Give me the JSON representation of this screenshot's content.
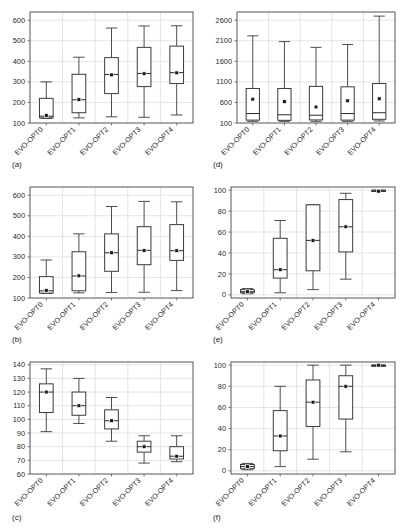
{
  "figure": {
    "categories": [
      "EVO-OPT0",
      "EVO-OPT1",
      "EVO-OPT2",
      "EVO-OPT3",
      "EVO-OPT4"
    ],
    "captions": [
      "(a)",
      "(b)",
      "(c)",
      "(d)",
      "(e)",
      "(f)"
    ],
    "colors": {
      "box_stroke": "#3a3a3a",
      "whisker": "#3a3a3a",
      "median": "#2b2b2b",
      "mean_marker": "#1a1a1a",
      "grid": "#d9d9d9",
      "axis": "#555555",
      "background": "#ffffff"
    }
  },
  "chart_data": [
    {
      "type": "box",
      "panel": "(a)",
      "title": "",
      "xlabel": "",
      "ylabel": "",
      "categories": [
        "EVO-OPT0",
        "EVO-OPT1",
        "EVO-OPT2",
        "EVO-OPT3",
        "EVO-OPT4"
      ],
      "ylim": [
        100,
        640
      ],
      "yticks": [
        100,
        200,
        300,
        400,
        500,
        600
      ],
      "ytick_labels": [
        "100",
        "200",
        "300",
        "400",
        "500",
        "600"
      ],
      "grid": true,
      "boxes": [
        {
          "category": "EVO-OPT0",
          "min": 122,
          "q1": 125,
          "median": 133,
          "q3": 220,
          "max": 300,
          "mean": 137
        },
        {
          "category": "EVO-OPT1",
          "min": 125,
          "q1": 150,
          "median": 213,
          "q3": 337,
          "max": 420,
          "mean": 214
        },
        {
          "category": "EVO-OPT2",
          "min": 130,
          "q1": 243,
          "median": 336,
          "q3": 418,
          "max": 562,
          "mean": 334
        },
        {
          "category": "EVO-OPT3",
          "min": 128,
          "q1": 277,
          "median": 341,
          "q3": 468,
          "max": 572,
          "mean": 340
        },
        {
          "category": "EVO-OPT4",
          "min": 139,
          "q1": 292,
          "median": 345,
          "q3": 474,
          "max": 573,
          "mean": 344
        }
      ]
    },
    {
      "type": "box",
      "panel": "(b)",
      "title": "",
      "xlabel": "",
      "ylabel": "",
      "categories": [
        "EVO-OPT0",
        "EVO-OPT1",
        "EVO-OPT2",
        "EVO-OPT3",
        "EVO-OPT4"
      ],
      "ylim": [
        100,
        640
      ],
      "yticks": [
        100,
        200,
        300,
        400,
        500,
        600
      ],
      "ytick_labels": [
        "100",
        "200",
        "300",
        "400",
        "500",
        "600"
      ],
      "grid": true,
      "boxes": [
        {
          "category": "EVO-OPT0",
          "min": 122,
          "q1": 124,
          "median": 135,
          "q3": 204,
          "max": 285,
          "mean": 137
        },
        {
          "category": "EVO-OPT1",
          "min": 125,
          "q1": 135,
          "median": 207,
          "q3": 325,
          "max": 412,
          "mean": 208
        },
        {
          "category": "EVO-OPT2",
          "min": 127,
          "q1": 230,
          "median": 320,
          "q3": 412,
          "max": 545,
          "mean": 320
        },
        {
          "category": "EVO-OPT3",
          "min": 128,
          "q1": 262,
          "median": 332,
          "q3": 447,
          "max": 570,
          "mean": 331
        },
        {
          "category": "EVO-OPT4",
          "min": 136,
          "q1": 283,
          "median": 330,
          "q3": 457,
          "max": 568,
          "mean": 330
        }
      ]
    },
    {
      "type": "box",
      "panel": "(c)",
      "title": "",
      "xlabel": "",
      "ylabel": "",
      "categories": [
        "EVO-OPT0",
        "EVO-OPT1",
        "EVO-OPT2",
        "EVO-OPT3",
        "EVO-OPT4"
      ],
      "ylim": [
        60,
        142
      ],
      "yticks": [
        60,
        70,
        80,
        90,
        100,
        110,
        120,
        130,
        140
      ],
      "ytick_labels": [
        "60",
        "70",
        "80",
        "90",
        "100",
        "110",
        "120",
        "130",
        "140"
      ],
      "grid": true,
      "boxes": [
        {
          "category": "EVO-OPT0",
          "min": 91,
          "q1": 105,
          "median": 120,
          "q3": 126,
          "max": 137,
          "mean": 120
        },
        {
          "category": "EVO-OPT1",
          "min": 97,
          "q1": 103,
          "median": 110,
          "q3": 120,
          "max": 130,
          "mean": 110
        },
        {
          "category": "EVO-OPT2",
          "min": 84,
          "q1": 93,
          "median": 99,
          "q3": 107,
          "max": 116,
          "mean": 99
        },
        {
          "category": "EVO-OPT3",
          "min": 68,
          "q1": 76,
          "median": 80,
          "q3": 84,
          "max": 88,
          "mean": 80
        },
        {
          "category": "EVO-OPT4",
          "min": 69,
          "q1": 71,
          "median": 73,
          "q3": 80,
          "max": 88,
          "mean": 73
        }
      ]
    },
    {
      "type": "box",
      "panel": "(d)",
      "title": "",
      "xlabel": "",
      "ylabel": "",
      "categories": [
        "EVO-OPT0",
        "EVO-OPT1",
        "EVO-OPT2",
        "EVO-OPT3",
        "EVO-OPT4"
      ],
      "ylim": [
        100,
        2800
      ],
      "yticks": [
        100,
        600,
        1100,
        1600,
        2100,
        2600
      ],
      "ytick_labels": [
        "100",
        "600",
        "1100",
        "1600",
        "2100",
        "2600"
      ],
      "grid": true,
      "boxes": [
        {
          "category": "EVO-OPT0",
          "min": 140,
          "q1": 170,
          "median": 330,
          "q3": 940,
          "max": 2220,
          "mean": 680
        },
        {
          "category": "EVO-OPT1",
          "min": 140,
          "q1": 165,
          "median": 300,
          "q3": 940,
          "max": 2080,
          "mean": 620
        },
        {
          "category": "EVO-OPT2",
          "min": 140,
          "q1": 175,
          "median": 290,
          "q3": 990,
          "max": 1940,
          "mean": 490
        },
        {
          "category": "EVO-OPT3",
          "min": 140,
          "q1": 170,
          "median": 330,
          "q3": 980,
          "max": 2010,
          "mean": 640
        },
        {
          "category": "EVO-OPT4",
          "min": 150,
          "q1": 190,
          "median": 350,
          "q3": 1060,
          "max": 2700,
          "mean": 690
        }
      ]
    },
    {
      "type": "box",
      "panel": "(e)",
      "title": "",
      "xlabel": "",
      "ylabel": "",
      "categories": [
        "EVO-OPT0",
        "EVO-OPT1",
        "EVO-OPT2",
        "EVO-OPT3",
        "EVO-OPT4"
      ],
      "ylim": [
        -3,
        103
      ],
      "yticks": [
        0,
        20,
        40,
        60,
        80,
        100
      ],
      "ytick_labels": [
        "0",
        "20",
        "40",
        "60",
        "80",
        "100"
      ],
      "grid": true,
      "boxes": [
        {
          "category": "EVO-OPT0",
          "min": 1,
          "q1": 2,
          "median": 3,
          "q3": 5,
          "max": 6,
          "mean": 3
        },
        {
          "category": "EVO-OPT1",
          "min": 2,
          "q1": 16,
          "median": 24,
          "q3": 54,
          "max": 71,
          "mean": 24
        },
        {
          "category": "EVO-OPT2",
          "min": 5,
          "q1": 23,
          "median": 52,
          "q3": 86,
          "max": 86,
          "mean": 52
        },
        {
          "category": "EVO-OPT3",
          "min": 15,
          "q1": 41,
          "median": 65,
          "q3": 91,
          "max": 97,
          "mean": 65
        },
        {
          "category": "EVO-OPT4",
          "min": 99,
          "q1": 99,
          "median": 99,
          "q3": 100,
          "max": 100,
          "mean": 99
        }
      ]
    },
    {
      "type": "box",
      "panel": "(f)",
      "title": "",
      "xlabel": "",
      "ylabel": "",
      "categories": [
        "EVO-OPT0",
        "EVO-OPT1",
        "EVO-OPT2",
        "EVO-OPT3",
        "EVO-OPT4"
      ],
      "ylim": [
        -3,
        103
      ],
      "yticks": [
        0,
        20,
        40,
        60,
        80,
        100
      ],
      "ytick_labels": [
        "0",
        "20",
        "40",
        "60",
        "80",
        "100"
      ],
      "grid": true,
      "boxes": [
        {
          "category": "EVO-OPT0",
          "min": 1,
          "q1": 2,
          "median": 4,
          "q3": 6,
          "max": 7,
          "mean": 4
        },
        {
          "category": "EVO-OPT1",
          "min": 4,
          "q1": 19,
          "median": 33,
          "q3": 57,
          "max": 80,
          "mean": 33
        },
        {
          "category": "EVO-OPT2",
          "min": 11,
          "q1": 42,
          "median": 65,
          "q3": 86,
          "max": 100,
          "mean": 65
        },
        {
          "category": "EVO-OPT3",
          "min": 18,
          "q1": 49,
          "median": 80,
          "q3": 90,
          "max": 100,
          "mean": 80
        },
        {
          "category": "EVO-OPT4",
          "min": 99,
          "q1": 99,
          "median": 100,
          "q3": 100,
          "max": 100,
          "mean": 100
        }
      ]
    }
  ]
}
